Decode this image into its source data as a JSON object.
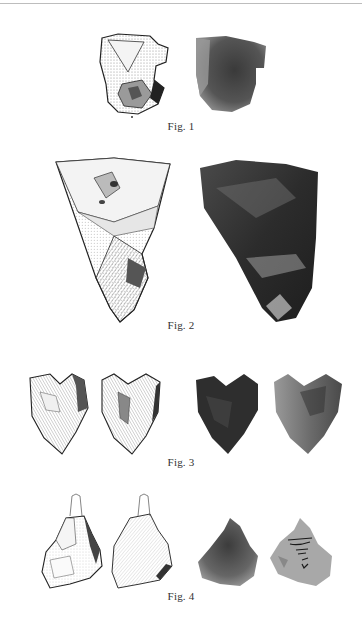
{
  "page": {
    "type": "plate of illustrated stone tools (drawings alongside photographs)",
    "background": "#ffffff"
  },
  "figures": [
    {
      "id": "fig1",
      "caption": "Fig. 1",
      "items": [
        {
          "kind": "drawing",
          "description": "stippled line drawing of flaked stone tool"
        },
        {
          "kind": "photograph",
          "description": "grayscale photo of the same stone tool"
        }
      ]
    },
    {
      "id": "fig2",
      "caption": "Fig. 2",
      "items": [
        {
          "kind": "drawing",
          "description": "stippled line drawing of triangular flint tool"
        },
        {
          "kind": "photograph",
          "description": "dark grayscale photo of triangular flint tool"
        }
      ]
    },
    {
      "id": "fig3",
      "caption": "Fig. 3",
      "items": [
        {
          "kind": "drawing",
          "description": "heart-shaped flint, face A"
        },
        {
          "kind": "drawing",
          "description": "heart-shaped flint, face B"
        },
        {
          "kind": "photograph",
          "description": "heart-shaped flint photo, face A"
        },
        {
          "kind": "photograph",
          "description": "heart-shaped flint photo, face B, with handwritten inscription"
        }
      ]
    },
    {
      "id": "fig4",
      "caption": "Fig. 4",
      "items": [
        {
          "kind": "drawing",
          "description": "pointed flint with outlined tip, face A"
        },
        {
          "kind": "drawing",
          "description": "pointed flint with outlined tip, face B"
        },
        {
          "kind": "photograph",
          "description": "pointed flint photo, face A"
        },
        {
          "kind": "photograph",
          "description": "pointed flint photo, face B, with handwritten label"
        }
      ],
      "handwritten_label": "Bambolles / Bojs"
    }
  ]
}
